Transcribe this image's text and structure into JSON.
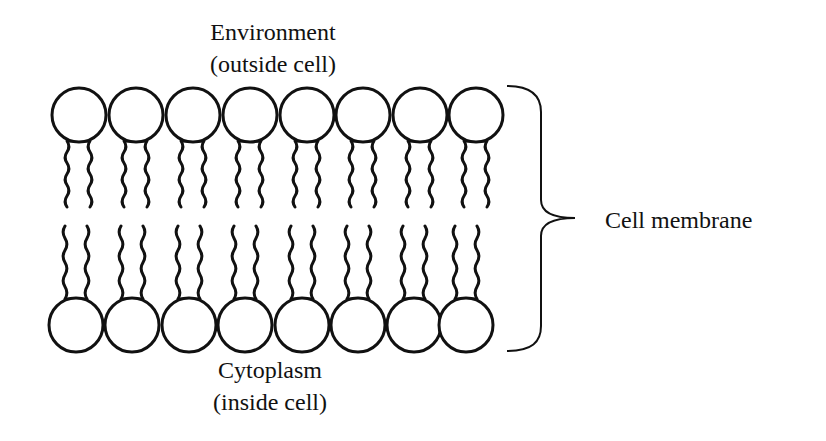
{
  "diagram": {
    "labels": {
      "top_line1": "Environment",
      "top_line2": "(outside cell)",
      "bottom_line1": "Cytoplasm",
      "bottom_line2": "(inside cell)",
      "brace_label": "Cell membrane"
    },
    "phospholipids": {
      "count_per_layer": 8,
      "top_heads_cx": [
        79,
        136,
        193,
        250,
        307,
        363,
        420,
        476
      ],
      "top_heads_cy": 115,
      "bottom_heads_cx": [
        76,
        132,
        189,
        245,
        302,
        358,
        414,
        466
      ],
      "bottom_heads_cy": 325,
      "head_radius": 27
    },
    "colors": {
      "stroke": "#111111",
      "background": "#ffffff"
    }
  }
}
